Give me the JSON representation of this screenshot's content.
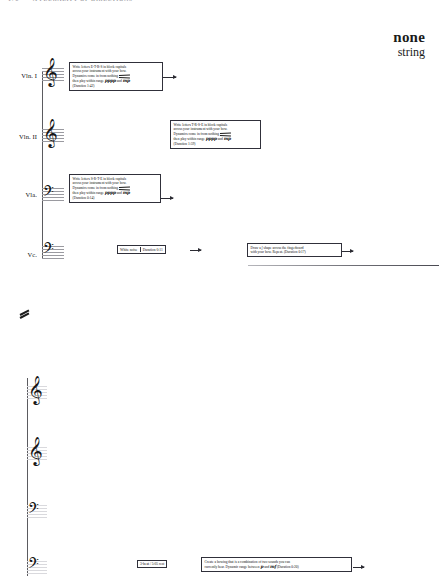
{
  "page": {
    "width": 439,
    "height": 582,
    "background": "#ffffff",
    "ink": "#101010"
  },
  "running_header": {
    "folio": "176",
    "text": "A PLURALITY OF DIRECTIONS"
  },
  "title": {
    "main": "none",
    "sub": "string"
  },
  "systems": [
    {
      "name": "system-1",
      "staves": [
        {
          "label": "Vln. I",
          "clef": "treble-clef",
          "clef_glyph": "𝄞"
        },
        {
          "label": "Vln. II",
          "clef": "treble-clef",
          "clef_glyph": "𝄞"
        },
        {
          "label": "Vla.",
          "clef": "alto-clef",
          "clef_glyph": "𝄢"
        },
        {
          "label": "Vc.",
          "clef": "bass-clef",
          "clef_glyph": "𝄢"
        }
      ]
    },
    {
      "name": "system-2",
      "staves": [
        {
          "label": "",
          "clef": "treble-clef",
          "clef_glyph": "𝄞"
        },
        {
          "label": "",
          "clef": "treble-clef",
          "clef_glyph": "𝄞"
        },
        {
          "label": "",
          "clef": "alto-clef",
          "clef_glyph": "𝄢"
        },
        {
          "label": "",
          "clef": "bass-clef",
          "clef_glyph": "𝄢"
        }
      ]
    }
  ],
  "instructions": {
    "violin1": {
      "line1": "Write letters E-T-R-S in block capitals",
      "line2": "across your instrument with your bow.",
      "line3": "Dynamics come in from nothing",
      "line4_pre": "then play within range",
      "dynamic_soft": "pppp",
      "line4_mid": "and",
      "dynamic_loud": "mp",
      "line5": "(Duration 1:42)"
    },
    "violin2": {
      "line1": "Write letters T-R-S-E in block capitals",
      "line2": "across your instrument with your bow.",
      "line3": "Dynamics come in from nothing",
      "line4_pre": "then play within range",
      "dynamic_soft": "pppp",
      "line4_mid": "and",
      "dynamic_loud": "mp",
      "line5": "(Duration 1:59)"
    },
    "viola": {
      "line1": "Write letters S-R-T-E in block capitals",
      "line2": "across your instrument with your bow.",
      "line3": "Dynamics come in from nothing",
      "line4_pre": "then play within range",
      "dynamic_soft": "pppp",
      "line4_mid": "and",
      "dynamic_loud": "mp",
      "line5": "(Duration 0:14)"
    },
    "cello_white_noise": {
      "label": "White noise",
      "duration": "Duration 0:11"
    },
    "cello_shape": {
      "line1": "Draw a ʃ shape across the fingerboard",
      "line2": "with your bow. Repeat. (Duration 0:17)"
    },
    "rest_box": {
      "label": "3-beat / 5:05 rest"
    },
    "bowing_box": {
      "line1": "Create a bowing that is a combination of two sounds you can",
      "line2_pre": "currently hear. Dynamic range between",
      "dynamic_soft": "p",
      "line2_mid": "and",
      "dynamic_loud": "mf",
      "line2_post": "(Duration 0:20)"
    }
  },
  "marks": {
    "caesura": "tremolo-slash-mark"
  }
}
